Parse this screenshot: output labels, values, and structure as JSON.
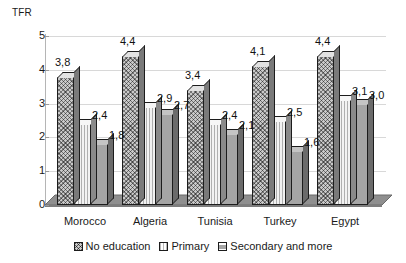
{
  "chart_data": {
    "type": "bar",
    "title": "",
    "ylabel": "TFR",
    "xlabel": "",
    "categories": [
      "Morocco",
      "Algeria",
      "Tunisia",
      "Turkey",
      "Egypt"
    ],
    "series": [
      {
        "name": "No education",
        "values": [
          3.8,
          4.4,
          3.4,
          4.1,
          4.4
        ],
        "labels": [
          "3,8",
          "4,4",
          "3,4",
          "4,1",
          "4,4"
        ]
      },
      {
        "name": "Primary",
        "values": [
          2.4,
          2.9,
          2.4,
          2.5,
          3.1
        ],
        "labels": [
          "2,4",
          "2,9",
          "2,4",
          "2,5",
          "3,1"
        ]
      },
      {
        "name": "Secondary and more",
        "values": [
          1.8,
          2.7,
          2.1,
          1.6,
          3.0
        ],
        "labels": [
          "1,8",
          "2,7",
          "2,1",
          "1,6",
          "3,0"
        ]
      }
    ],
    "ylim": [
      0,
      5
    ],
    "yticks": [
      0,
      1,
      2,
      3,
      4,
      5
    ],
    "ytick_labels": [
      "0",
      "1",
      "2",
      "3",
      "4",
      "5"
    ],
    "grid": true,
    "legend_position": "bottom",
    "decimal_separator": ","
  },
  "axis": {
    "y_title": "TFR",
    "ticks": [
      "5",
      "4",
      "3",
      "2",
      "1",
      "0"
    ]
  },
  "categories": [
    {
      "label": "Morocco"
    },
    {
      "label": "Algeria"
    },
    {
      "label": "Tunisia"
    },
    {
      "label": "Turkey"
    },
    {
      "label": "Egypt"
    }
  ],
  "legend": {
    "items": [
      {
        "label": "No education"
      },
      {
        "label": "Primary"
      },
      {
        "label": "Secondary and more"
      }
    ]
  },
  "values": {
    "morocco": {
      "no_education": "3,8",
      "primary": "2,4",
      "secondary": "1,8"
    },
    "algeria": {
      "no_education": "4,4",
      "primary": "2,9",
      "secondary": "2,7"
    },
    "tunisia": {
      "no_education": "3,4",
      "primary": "2,4",
      "secondary": "2,1"
    },
    "turkey": {
      "no_education": "4,1",
      "primary": "2,5",
      "secondary": "1,6"
    },
    "egypt": {
      "no_education": "4,4",
      "primary": "3,1",
      "secondary": "3,0"
    }
  },
  "colors": {
    "series_no_education": "#c9c9c9",
    "series_primary": "#f2f2f2",
    "series_secondary": "#a5a5a5",
    "outline": "#1c1c1c",
    "gridline": "#d8d8d8",
    "floor": "#8f8f8f"
  }
}
